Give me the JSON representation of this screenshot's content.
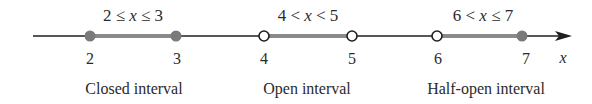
{
  "diagram": {
    "axis_variable": "x",
    "tick_labels": [
      "2",
      "3",
      "4",
      "5",
      "6",
      "7"
    ],
    "colors": {
      "axis": "#1f1f1f",
      "interval": "#8a8a8a",
      "closed_point": "#7a7a7a",
      "open_point_fill": "#ffffff"
    },
    "intervals": [
      {
        "inequality_left": "2 ≤ ",
        "var": "x",
        "inequality_right": " ≤ 3",
        "caption": "Closed interval",
        "left": "2",
        "right": "3",
        "left_closed": true,
        "right_closed": true
      },
      {
        "inequality_left": "4 < ",
        "var": "x",
        "inequality_right": " < 5",
        "caption": "Open interval",
        "left": "4",
        "right": "5",
        "left_closed": false,
        "right_closed": false
      },
      {
        "inequality_left": "6 < ",
        "var": "x",
        "inequality_right": " ≤ 7",
        "caption": "Half-open interval",
        "left": "6",
        "right": "7",
        "left_closed": false,
        "right_closed": true
      }
    ]
  }
}
